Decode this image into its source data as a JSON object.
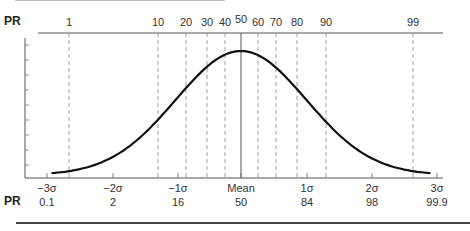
{
  "chart_data": {
    "type": "line",
    "title": "",
    "top_axis": {
      "label": "PR",
      "ticks": [
        {
          "label": "1",
          "x": 69
        },
        {
          "label": "10",
          "x": 158
        },
        {
          "label": "20",
          "x": 186
        },
        {
          "label": "30",
          "x": 207
        },
        {
          "label": "40",
          "x": 225
        },
        {
          "label": "50",
          "x": 241
        },
        {
          "label": "60",
          "x": 258
        },
        {
          "label": "70",
          "x": 276
        },
        {
          "label": "80",
          "x": 297
        },
        {
          "label": "90",
          "x": 326
        },
        {
          "label": "99",
          "x": 413
        }
      ]
    },
    "bottom_axis": {
      "ticks": [
        {
          "label": "−3σ",
          "pr": "0.1",
          "x": 47
        },
        {
          "label": "−2σ",
          "pr": "2",
          "x": 113
        },
        {
          "label": "−1σ",
          "pr": "16",
          "x": 178
        },
        {
          "label": "Mean",
          "pr": "50",
          "x": 241
        },
        {
          "label": "1σ",
          "pr": "84",
          "x": 307
        },
        {
          "label": "2σ",
          "pr": "98",
          "x": 372
        },
        {
          "label": "3σ",
          "pr": "99.9",
          "x": 437
        }
      ],
      "pr_row_label": "PR"
    },
    "series": [
      {
        "name": "normal curve",
        "x": [
          -3,
          -2.5,
          -2,
          -1.5,
          -1,
          -0.5,
          0,
          0.5,
          1,
          1.5,
          2,
          2.5,
          3
        ],
        "values": [
          0.004,
          0.018,
          0.054,
          0.13,
          0.242,
          0.352,
          0.399,
          0.352,
          0.242,
          0.13,
          0.054,
          0.018,
          0.004
        ]
      }
    ],
    "xlabel": "Standard deviations from mean",
    "ylabel": "",
    "xlim": [
      -3,
      3
    ],
    "grid": "dashed vertical lines at percentile ranks"
  },
  "labels": {
    "pr_top": "PR",
    "pr_bottom": "PR"
  }
}
